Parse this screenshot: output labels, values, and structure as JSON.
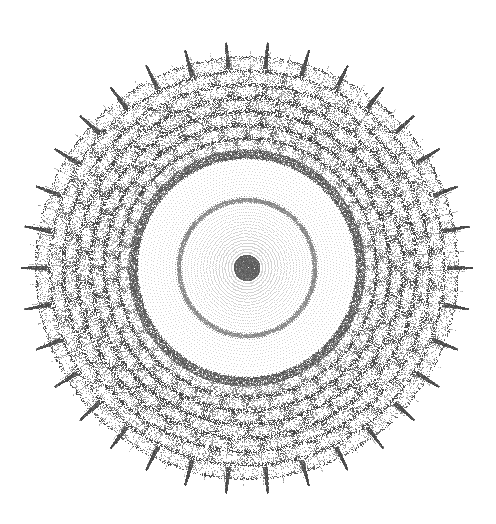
{
  "figure": {
    "title": "Radial point cloud mandala",
    "type": "scatter",
    "width": 496,
    "height": 524,
    "background_color": "#ffffff",
    "point_color": "#555555",
    "point_size_px": 1,
    "has_axes": false,
    "has_gridlines": false,
    "has_legend": false,
    "has_labels": false
  },
  "chart_data": {
    "type": "scatter",
    "title": "",
    "subtitle": "",
    "xlabel": "",
    "ylabel": "",
    "xlim": [
      0,
      496
    ],
    "ylim": [
      0,
      524
    ],
    "grid": false,
    "legend": null,
    "annotations": [],
    "coordinate_system": "polar",
    "center": {
      "x": 247,
      "y": 268
    },
    "radii": {
      "outer_radius": 218,
      "inner_disc_radius": 113,
      "intermediate_ring_radius": 68,
      "core_radius": 6
    },
    "structure": {
      "spoke_count": 233,
      "points_per_spoke": 420,
      "radial_growth": "linear",
      "angular_twist_per_radius": 0.0115,
      "scale_cell_rows": 7,
      "scale_cell_columns": 34,
      "inner_dot_spacing_px": 3.1
    },
    "density_bands": [
      {
        "name": "core",
        "r_min": 0,
        "r_max": 12,
        "relative_density": 1.0,
        "gray": "#6a6a6a"
      },
      {
        "name": "inner-spokes",
        "r_min": 12,
        "r_max": 68,
        "relative_density": 0.22,
        "gray": "#7d7d7d"
      },
      {
        "name": "inner-ring-arc",
        "r_min": 65,
        "r_max": 72,
        "relative_density": 0.45,
        "gray": "#707070"
      },
      {
        "name": "mid-spokes",
        "r_min": 72,
        "r_max": 110,
        "relative_density": 0.2,
        "gray": "#808080"
      },
      {
        "name": "transition-rim",
        "r_min": 110,
        "r_max": 120,
        "relative_density": 0.85,
        "gray": "#5a5a5a"
      },
      {
        "name": "outer-caustic-annulus",
        "r_min": 120,
        "r_max": 212,
        "relative_density": 0.95,
        "gray": "#666666"
      },
      {
        "name": "outer-spikes",
        "r_min": 205,
        "r_max": 222,
        "relative_density": 0.6,
        "gray": "#555555"
      }
    ],
    "series": [
      {
        "name": "radial point cloud",
        "marker": "point",
        "color": "#555555",
        "approx_point_count": 97800
      }
    ]
  }
}
